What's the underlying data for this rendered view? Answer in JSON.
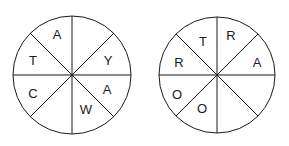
{
  "puzzle": {
    "wheels": [
      {
        "name": "left-wheel",
        "cx": 72,
        "cy": 75,
        "r": 59,
        "letters": [
          {
            "char": "A",
            "x": 57,
            "y": 34
          },
          {
            "char": "Y",
            "x": 108,
            "y": 60
          },
          {
            "char": "A",
            "x": 107,
            "y": 89
          },
          {
            "char": "W",
            "x": 86,
            "y": 109
          },
          {
            "char": "C",
            "x": 33,
            "y": 93
          },
          {
            "char": "T",
            "x": 33,
            "y": 60
          }
        ]
      },
      {
        "name": "right-wheel",
        "cx": 217,
        "cy": 75,
        "r": 58,
        "letters": [
          {
            "char": "T",
            "x": 203,
            "y": 41
          },
          {
            "char": "R",
            "x": 231,
            "y": 35
          },
          {
            "char": "A",
            "x": 257,
            "y": 62
          },
          {
            "char": "O",
            "x": 202,
            "y": 108
          },
          {
            "char": "O",
            "x": 177,
            "y": 94
          },
          {
            "char": "R",
            "x": 179,
            "y": 62
          }
        ]
      }
    ]
  }
}
